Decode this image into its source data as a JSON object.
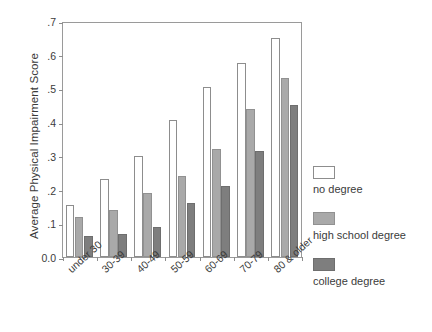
{
  "chart_data": {
    "type": "bar",
    "title": "",
    "subtitle": "",
    "xlabel": "",
    "ylabel": "Average Physical Impairment Score",
    "categories": [
      "under 30",
      "30-39",
      "40-49",
      "50-59",
      "60-69",
      "70-79",
      "80 & older"
    ],
    "series": [
      {
        "name": "no degree",
        "color": "#ffffff",
        "values": [
          0.155,
          0.23,
          0.3,
          0.405,
          0.505,
          0.575,
          0.65
        ]
      },
      {
        "name": "high school degree",
        "color": "#a9a9a9",
        "values": [
          0.12,
          0.14,
          0.19,
          0.24,
          0.32,
          0.44,
          0.53
        ]
      },
      {
        "name": "college degree",
        "color": "#7e7e7e",
        "values": [
          0.063,
          0.068,
          0.09,
          0.16,
          0.21,
          0.315,
          0.45
        ]
      }
    ],
    "ylim": [
      0.0,
      0.7
    ],
    "yticks": [
      "0.0",
      ".1",
      ".2",
      ".3",
      ".4",
      ".5",
      ".6",
      ".7"
    ],
    "ytick_values": [
      0.0,
      0.1,
      0.2,
      0.3,
      0.4,
      0.5,
      0.6,
      0.7
    ],
    "grid": false,
    "legend_position": "right",
    "legend_entries": [
      "no degree",
      "high school degree",
      "college degree"
    ]
  }
}
